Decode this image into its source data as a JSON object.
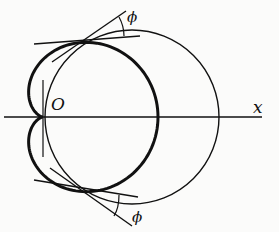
{
  "figure": {
    "colors": {
      "stroke": "#111111",
      "background": "#fbfbfa"
    },
    "labels": {
      "origin": "O",
      "x_axis": "x",
      "angle_top": "ϕ",
      "angle_bottom": "ϕ"
    }
  }
}
